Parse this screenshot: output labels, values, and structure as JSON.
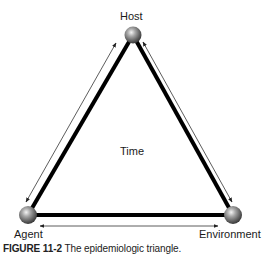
{
  "diagram": {
    "title": "Epidemiologic triangle",
    "nodes": [
      {
        "id": "host",
        "label": "Host"
      },
      {
        "id": "agent",
        "label": "Agent"
      },
      {
        "id": "environment",
        "label": "Environment"
      }
    ],
    "center_label": "Time",
    "edges": [
      {
        "from": "agent",
        "to": "host",
        "bidirectional": true
      },
      {
        "from": "host",
        "to": "environment",
        "bidirectional": true
      },
      {
        "from": "agent",
        "to": "environment",
        "bidirectional": true
      }
    ],
    "colors": {
      "edge": "#000000",
      "node": "#808080",
      "arrow": "#333333"
    }
  },
  "caption": {
    "figure_number": "FIGURE 11-2",
    "text": " The epidemiologic triangle."
  }
}
